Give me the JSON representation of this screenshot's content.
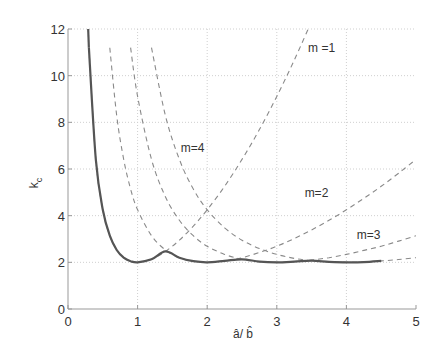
{
  "chart_data": {
    "type": "line",
    "title": "",
    "xlabel": "a/b",
    "xlabel_display": "â/ b̂",
    "ylabel": "k_c",
    "ylabel_main": "k",
    "ylabel_sub": "c",
    "xlim": [
      0,
      5
    ],
    "ylim": [
      0,
      12
    ],
    "xticks": [
      0,
      1,
      2,
      3,
      4,
      5
    ],
    "yticks": [
      0,
      2,
      4,
      6,
      8,
      10,
      12
    ],
    "grid": true,
    "legend": "none (inline annotations)",
    "x": [
      0.3,
      0.4,
      0.5,
      0.6,
      0.7,
      0.8,
      0.9,
      1.0,
      1.2,
      1.4,
      1.6,
      1.8,
      2.0,
      2.25,
      2.5,
      2.75,
      3.0,
      3.25,
      3.5,
      3.75,
      4.0,
      4.25,
      4.5,
      4.75,
      5.0
    ],
    "series": [
      {
        "name": "m=1",
        "style": "dashed",
        "values": [
          11.2,
          6.41,
          4.25,
          3.14,
          2.53,
          2.2,
          2.05,
          2.0,
          2.13,
          2.47,
          2.95,
          3.55,
          4.25,
          5.26,
          6.41,
          7.69,
          9.11,
          10.66,
          12.33,
          null,
          null,
          null,
          null,
          null,
          null
        ]
      },
      {
        "name": "m=2",
        "style": "dashed",
        "values": [
          null,
          null,
          null,
          11.2,
          8.29,
          6.41,
          5.14,
          4.25,
          3.14,
          2.53,
          2.2,
          2.05,
          2.0,
          2.06,
          2.2,
          2.42,
          2.69,
          3.02,
          3.39,
          3.8,
          4.25,
          4.74,
          5.26,
          5.82,
          6.41
        ]
      },
      {
        "name": "m=3",
        "style": "dashed",
        "values": [
          null,
          null,
          null,
          null,
          null,
          null,
          11.2,
          9.11,
          6.41,
          4.81,
          3.8,
          3.14,
          2.69,
          2.34,
          2.13,
          2.03,
          2.0,
          2.03,
          2.1,
          2.2,
          2.34,
          2.51,
          2.69,
          2.91,
          3.14
        ]
      },
      {
        "name": "m=4",
        "style": "dashed",
        "values": [
          null,
          null,
          null,
          null,
          null,
          null,
          null,
          null,
          11.2,
          8.29,
          6.41,
          5.14,
          4.25,
          3.48,
          2.95,
          2.59,
          2.34,
          2.17,
          2.07,
          2.02,
          2.0,
          2.01,
          2.06,
          2.12,
          2.2
        ]
      },
      {
        "name": "envelope (min over m)",
        "style": "solid",
        "x_range": [
          0.29,
          4.5
        ],
        "values": [
          11.2,
          6.41,
          4.25,
          3.14,
          2.53,
          2.2,
          2.05,
          2.0,
          2.13,
          2.47,
          2.2,
          2.05,
          2.0,
          2.06,
          2.13,
          2.03,
          2.0,
          2.03,
          2.07,
          2.02,
          2.0,
          2.01,
          2.06,
          null,
          null
        ]
      }
    ],
    "annotations": [
      {
        "text": "m =1",
        "x": 3.45,
        "y": 11.0
      },
      {
        "text": "m=4",
        "x": 1.62,
        "y": 6.75
      },
      {
        "text": "m=2",
        "x": 3.4,
        "y": 4.8
      },
      {
        "text": "m=3",
        "x": 4.15,
        "y": 3.0
      }
    ],
    "colors": {
      "solid": "#555555",
      "dashed": "#8a8a8a",
      "grid": "#cfcfcf",
      "axis": "#999999",
      "text": "#333333"
    }
  }
}
